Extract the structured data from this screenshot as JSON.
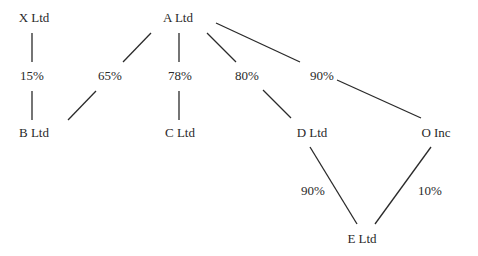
{
  "diagram": {
    "type": "ownership-structure",
    "nodes": [
      {
        "id": "x",
        "label": "X Ltd",
        "x": 34,
        "y": 22
      },
      {
        "id": "a",
        "label": "A Ltd",
        "x": 178,
        "y": 22
      },
      {
        "id": "b",
        "label": "B Ltd",
        "x": 34,
        "y": 137
      },
      {
        "id": "c",
        "label": "C Ltd",
        "x": 180,
        "y": 137
      },
      {
        "id": "d",
        "label": "D Ltd",
        "x": 312,
        "y": 137
      },
      {
        "id": "o",
        "label": "O Inc",
        "x": 436,
        "y": 137
      },
      {
        "id": "e",
        "label": "E Ltd",
        "x": 362,
        "y": 243
      }
    ],
    "edges": [
      {
        "from": "X Ltd",
        "to": "B Ltd",
        "label": "15%",
        "lx": 32,
        "ly": 80
      },
      {
        "from": "A Ltd",
        "to": "B Ltd",
        "label": "65%",
        "lx": 110,
        "ly": 80
      },
      {
        "from": "A Ltd",
        "to": "C Ltd",
        "label": "78%",
        "lx": 180,
        "ly": 80
      },
      {
        "from": "A Ltd",
        "to": "D Ltd",
        "label": "80%",
        "lx": 247,
        "ly": 80
      },
      {
        "from": "A Ltd",
        "to": "O Inc",
        "label": "90%",
        "lx": 322,
        "ly": 80
      },
      {
        "from": "D Ltd",
        "to": "E Ltd",
        "label": "90%",
        "lx": 313,
        "ly": 195
      },
      {
        "from": "O Inc",
        "to": "E Ltd",
        "label": "10%",
        "lx": 430,
        "ly": 195
      }
    ]
  }
}
